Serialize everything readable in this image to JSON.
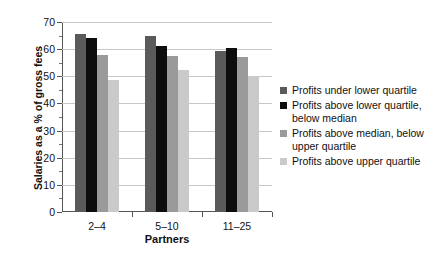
{
  "chart_data": {
    "type": "bar",
    "title": "",
    "xlabel": "Partners",
    "ylabel": "Salaries as a % of gross fees",
    "categories": [
      "2–4",
      "5–10",
      "11–25"
    ],
    "ylim": [
      0,
      70
    ],
    "ytick_labels": [
      "0",
      "10",
      "20",
      "30",
      "40",
      "50",
      "60",
      "70"
    ],
    "ytick_values": [
      0,
      10,
      20,
      30,
      40,
      50,
      60,
      70
    ],
    "yminor_values": [
      5,
      15,
      25,
      35,
      45,
      55,
      65
    ],
    "grid": true,
    "legend_position": "right",
    "series": [
      {
        "name": "Profits under lower quartile",
        "color": "#5a5a5a",
        "values": [
          65.5,
          65,
          59.5
        ]
      },
      {
        "name": "Profits above lower quartile, below median",
        "color": "#0d0d0d",
        "values": [
          64,
          61,
          60.5
        ]
      },
      {
        "name": "Profits above median, below upper quartile",
        "color": "#9a9a9a",
        "values": [
          58,
          57.5,
          57
        ]
      },
      {
        "name": "Profits above upper quartile",
        "color": "#cacaca",
        "values": [
          48.5,
          52.5,
          50
        ]
      }
    ]
  },
  "legend": {
    "items": [
      {
        "label": "Profits under lower quartile",
        "color": "#5a5a5a"
      },
      {
        "label": "Profits above lower quartile, below median",
        "color": "#0d0d0d"
      },
      {
        "label": "Profits above median, below upper quartile",
        "color": "#9a9a9a"
      },
      {
        "label": "Profits above upper quartile",
        "color": "#cacaca"
      }
    ]
  }
}
